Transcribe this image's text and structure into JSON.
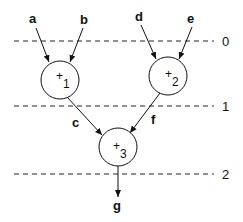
{
  "diagram": {
    "type": "dataflow-graph",
    "inputs": [
      "a",
      "b",
      "d",
      "e"
    ],
    "nodes": [
      {
        "id": "n1",
        "op": "+",
        "index": "1",
        "inputs": [
          "a",
          "b"
        ],
        "output": "c"
      },
      {
        "id": "n2",
        "op": "+",
        "index": "2",
        "inputs": [
          "d",
          "e"
        ],
        "output": "f"
      },
      {
        "id": "n3",
        "op": "+",
        "index": "3",
        "inputs": [
          "c",
          "f"
        ],
        "output": "g"
      }
    ],
    "edge_labels": {
      "a": "a",
      "b": "b",
      "d": "d",
      "e": "e",
      "c": "c",
      "f": "f",
      "g": "g"
    },
    "levels": [
      "0",
      "1",
      "2"
    ]
  }
}
